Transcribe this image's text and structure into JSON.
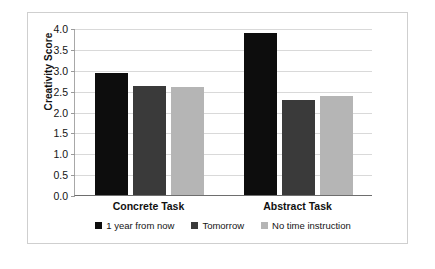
{
  "chart_data": {
    "type": "bar",
    "title": "",
    "xlabel": "",
    "ylabel": "Creativity Score",
    "ylim": [
      0.0,
      4.0
    ],
    "ytick_labels": [
      "4.0",
      "3.5",
      "3.0",
      "2.5",
      "2.0",
      "1.5",
      "1.0",
      "0.5",
      "0.0"
    ],
    "ytick_values": [
      4.0,
      3.5,
      3.0,
      2.5,
      2.0,
      1.5,
      1.0,
      0.5,
      0.0
    ],
    "grid": true,
    "legend_position": "bottom",
    "categories": [
      "Concrete Task",
      "Abstract Task"
    ],
    "series": [
      {
        "name": "1 year from now",
        "color": "#0d0d0d",
        "values": [
          2.93,
          3.88
        ]
      },
      {
        "name": "Tomorrow",
        "color": "#3a3a3a",
        "values": [
          2.6,
          2.27
        ]
      },
      {
        "name": "No time instruction",
        "color": "#b5b5b5",
        "values": [
          2.58,
          2.38
        ]
      }
    ]
  }
}
